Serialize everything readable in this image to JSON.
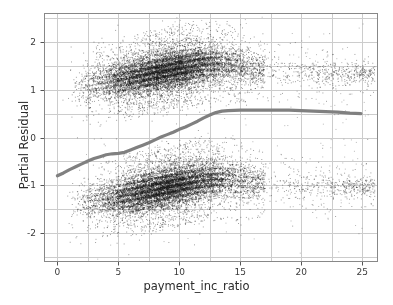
{
  "figure": {
    "width": 393,
    "height": 305,
    "background": "#ffffff"
  },
  "plot_area": {
    "left": 44,
    "top": 13,
    "right": 378,
    "bottom": 262,
    "border_color": "#888888",
    "grid_color": "#cccccc",
    "background": "#ffffff"
  },
  "axes": {
    "x_label": "payment_inc_ratio",
    "y_label": "Partial Residual",
    "x_ticks": [
      "0",
      "5",
      "10",
      "15",
      "20",
      "25"
    ],
    "y_ticks": [
      "2",
      "1",
      "0",
      "-1",
      "-2"
    ]
  },
  "chart_data": {
    "type": "scatter",
    "title": "",
    "xlabel": "payment_inc_ratio",
    "ylabel": "Partial Residual",
    "xlim": [
      -1.1,
      26.3
    ],
    "ylim": [
      -2.6,
      2.6
    ],
    "x_ticks": [
      0,
      5,
      10,
      15,
      20,
      25
    ],
    "y_ticks": [
      -2,
      -1,
      0,
      1,
      2
    ],
    "grid": true,
    "minor_grid_x_step": 2.5,
    "minor_grid_y_step": 0.5,
    "legend": "none",
    "point_color": "#1a1a1a",
    "point_size": 0.8,
    "point_opacity": 0.45,
    "n_points_approx": 22000,
    "series": [
      {
        "name": "upper-residual-cluster",
        "center_y_at_x": [
          {
            "x": 0.0,
            "y": 0.88
          },
          {
            "x": 1.0,
            "y": 0.98
          },
          {
            "x": 2.0,
            "y": 1.06
          },
          {
            "x": 3.0,
            "y": 1.12
          },
          {
            "x": 4.0,
            "y": 1.17
          },
          {
            "x": 5.0,
            "y": 1.21
          },
          {
            "x": 6.0,
            "y": 1.26
          },
          {
            "x": 7.0,
            "y": 1.31
          },
          {
            "x": 8.0,
            "y": 1.36
          },
          {
            "x": 9.0,
            "y": 1.41
          },
          {
            "x": 10.0,
            "y": 1.46
          },
          {
            "x": 11.0,
            "y": 1.5
          },
          {
            "x": 12.0,
            "y": 1.54
          },
          {
            "x": 13.0,
            "y": 1.55
          },
          {
            "x": 14.0,
            "y": 1.53
          },
          {
            "x": 15.0,
            "y": 1.49
          },
          {
            "x": 16.0,
            "y": 1.45
          },
          {
            "x": 18.0,
            "y": 1.4
          },
          {
            "x": 20.0,
            "y": 1.37
          },
          {
            "x": 23.0,
            "y": 1.35
          },
          {
            "x": 25.0,
            "y": 1.34
          }
        ],
        "spread": 0.3
      },
      {
        "name": "lower-residual-cluster",
        "center_y_at_x": [
          {
            "x": 0.0,
            "y": -1.5
          },
          {
            "x": 1.0,
            "y": -1.42
          },
          {
            "x": 2.0,
            "y": -1.36
          },
          {
            "x": 3.0,
            "y": -1.31
          },
          {
            "x": 4.0,
            "y": -1.27
          },
          {
            "x": 5.0,
            "y": -1.23
          },
          {
            "x": 6.0,
            "y": -1.18
          },
          {
            "x": 7.0,
            "y": -1.13
          },
          {
            "x": 8.0,
            "y": -1.08
          },
          {
            "x": 9.0,
            "y": -1.03
          },
          {
            "x": 10.0,
            "y": -0.98
          },
          {
            "x": 11.0,
            "y": -0.93
          },
          {
            "x": 12.0,
            "y": -0.89
          },
          {
            "x": 13.0,
            "y": -0.87
          },
          {
            "x": 14.0,
            "y": -0.88
          },
          {
            "x": 15.0,
            "y": -0.91
          },
          {
            "x": 16.0,
            "y": -0.94
          },
          {
            "x": 18.0,
            "y": -0.98
          },
          {
            "x": 20.0,
            "y": -1.0
          },
          {
            "x": 23.0,
            "y": -1.02
          },
          {
            "x": 25.0,
            "y": -1.03
          }
        ],
        "spread": 0.3
      }
    ],
    "smoother": {
      "name": "smoothing-spline",
      "color": "#808080",
      "linewidth": 3.2,
      "points": [
        {
          "x": 0.0,
          "y": -0.8
        },
        {
          "x": 0.5,
          "y": -0.74
        },
        {
          "x": 1.0,
          "y": -0.67
        },
        {
          "x": 1.5,
          "y": -0.61
        },
        {
          "x": 2.0,
          "y": -0.55
        },
        {
          "x": 2.5,
          "y": -0.49
        },
        {
          "x": 3.0,
          "y": -0.44
        },
        {
          "x": 3.5,
          "y": -0.4
        },
        {
          "x": 4.0,
          "y": -0.36
        },
        {
          "x": 4.5,
          "y": -0.34
        },
        {
          "x": 5.0,
          "y": -0.33
        },
        {
          "x": 5.5,
          "y": -0.31
        },
        {
          "x": 6.0,
          "y": -0.26
        },
        {
          "x": 6.5,
          "y": -0.21
        },
        {
          "x": 7.0,
          "y": -0.16
        },
        {
          "x": 7.5,
          "y": -0.11
        },
        {
          "x": 8.0,
          "y": -0.05
        },
        {
          "x": 8.5,
          "y": 0.01
        },
        {
          "x": 9.0,
          "y": 0.06
        },
        {
          "x": 9.5,
          "y": 0.11
        },
        {
          "x": 10.0,
          "y": 0.17
        },
        {
          "x": 10.5,
          "y": 0.22
        },
        {
          "x": 11.0,
          "y": 0.28
        },
        {
          "x": 11.5,
          "y": 0.34
        },
        {
          "x": 12.0,
          "y": 0.41
        },
        {
          "x": 12.5,
          "y": 0.47
        },
        {
          "x": 13.0,
          "y": 0.52
        },
        {
          "x": 13.5,
          "y": 0.55
        },
        {
          "x": 14.0,
          "y": 0.56
        },
        {
          "x": 15.0,
          "y": 0.57
        },
        {
          "x": 16.0,
          "y": 0.57
        },
        {
          "x": 17.0,
          "y": 0.57
        },
        {
          "x": 18.0,
          "y": 0.57
        },
        {
          "x": 19.0,
          "y": 0.57
        },
        {
          "x": 20.0,
          "y": 0.56
        },
        {
          "x": 21.0,
          "y": 0.55
        },
        {
          "x": 22.0,
          "y": 0.54
        },
        {
          "x": 23.0,
          "y": 0.53
        },
        {
          "x": 24.0,
          "y": 0.51
        },
        {
          "x": 24.9,
          "y": 0.5
        }
      ]
    }
  }
}
